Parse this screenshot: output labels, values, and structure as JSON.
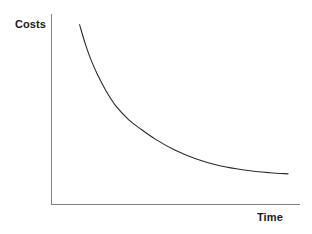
{
  "chart_data": {
    "type": "line",
    "title": "",
    "subtitle": "",
    "xlabel": "Time",
    "ylabel": "Costs",
    "grid": false,
    "legend": null,
    "legend_position": "none",
    "axis_ticks": {
      "x": [],
      "y": []
    },
    "xlim": [
      0,
      1
    ],
    "ylim": [
      0,
      1
    ],
    "annotations": [],
    "series": [
      {
        "name": "Costs over time",
        "description": "Monotonically decreasing convex curve approaching a horizontal asymptote",
        "x": [
          0.113,
          0.137,
          0.157,
          0.185,
          0.218,
          0.258,
          0.31,
          0.358,
          0.419,
          0.496,
          0.58,
          0.677,
          0.782,
          0.879,
          0.952
        ],
        "y": [
          0.944,
          0.839,
          0.766,
          0.682,
          0.6,
          0.519,
          0.446,
          0.397,
          0.342,
          0.286,
          0.24,
          0.203,
          0.18,
          0.167,
          0.161
        ]
      }
    ]
  },
  "labels": {
    "y_axis": "Costs",
    "x_axis": "Time"
  },
  "colors": {
    "background": "#ffffff",
    "axis": "#808080",
    "curve": "#2b2b2b",
    "text": "#1a1a1a"
  }
}
